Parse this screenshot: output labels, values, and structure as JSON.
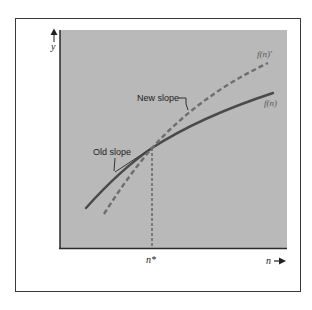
{
  "diagram": {
    "type": "function-slope-comparison",
    "axes": {
      "y_label": "y",
      "x_label": "n",
      "x_marker_label": "n*"
    },
    "curves": [
      {
        "name": "f(n)",
        "style": "solid",
        "color": "#4a4a4a"
      },
      {
        "name": "f(n)'",
        "style": "dashed",
        "color": "#6e6e6e"
      }
    ],
    "annotations": {
      "new_slope": "New slope",
      "old_slope": "Old slope"
    },
    "colors": {
      "panel_background": "#b9b9b9",
      "frame": "#3a3a3a",
      "axis": "#2a2a2a",
      "text": "#222222",
      "curve_label": "#555555"
    }
  }
}
